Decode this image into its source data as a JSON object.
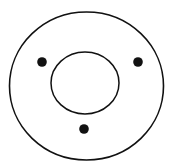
{
  "diagram": {
    "background": "#ffffff",
    "stroke_color": "#111111",
    "outer_circle": {
      "cx": 86.5,
      "cy": 86,
      "rx": 77,
      "ry": 74,
      "stroke_width": 1.6
    },
    "inner_circle": {
      "cx": 85,
      "cy": 83,
      "rx": 34,
      "ry": 31,
      "stroke_width": 1.5
    },
    "dots": [
      {
        "cx": 42,
        "cy": 62,
        "r": 4.8
      },
      {
        "cx": 138,
        "cy": 62,
        "r": 4.8
      },
      {
        "cx": 84,
        "cy": 129,
        "r": 4.8
      }
    ]
  }
}
